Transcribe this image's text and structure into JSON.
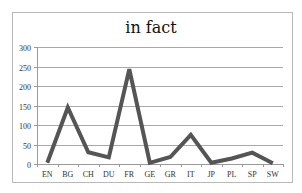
{
  "chart_data": {
    "type": "line",
    "title": "in fact",
    "xlabel": "",
    "ylabel": "",
    "categories": [
      "EN",
      "BG",
      "CH",
      "DU",
      "FR",
      "GE",
      "GR",
      "IT",
      "JP",
      "PL",
      "SP",
      "SW"
    ],
    "series": [
      {
        "name": "in fact",
        "values": [
          3,
          145,
          30,
          17,
          243,
          3,
          18,
          75,
          3,
          14,
          29,
          2
        ],
        "color": "#555555"
      }
    ],
    "ylim": [
      0,
      300
    ],
    "yticks": [
      0,
      50,
      100,
      150,
      200,
      250,
      300
    ],
    "grid": true,
    "legend": "none"
  }
}
